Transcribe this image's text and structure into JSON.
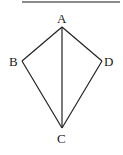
{
  "diagram": {
    "type": "quadrilateral-kite",
    "points": [
      {
        "id": "A",
        "label": "A"
      },
      {
        "id": "B",
        "label": "B"
      },
      {
        "id": "C",
        "label": "C"
      },
      {
        "id": "D",
        "label": "D"
      }
    ],
    "segments": [
      {
        "from": "A",
        "to": "B"
      },
      {
        "from": "B",
        "to": "C"
      },
      {
        "from": "C",
        "to": "D"
      },
      {
        "from": "D",
        "to": "A"
      },
      {
        "from": "A",
        "to": "C"
      }
    ]
  }
}
